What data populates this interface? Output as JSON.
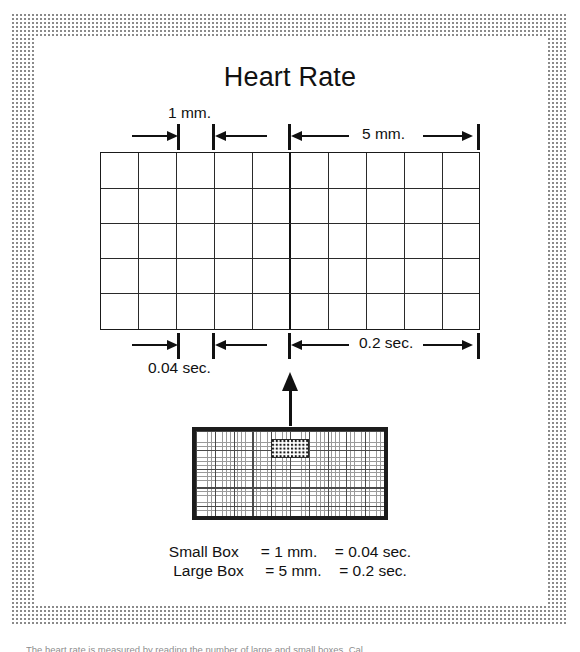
{
  "figure": {
    "title": "Heart Rate",
    "domain_note": "ECG paper calibration diagram"
  },
  "annotations": {
    "top": {
      "small_box_label": "1 mm.",
      "large_box_label": "5 mm."
    },
    "bottom": {
      "small_box_label": "0.04 sec.",
      "large_box_label": "0.2 sec."
    }
  },
  "legend": {
    "rows": [
      {
        "name": "Small Box",
        "size": "= 1 mm.",
        "time": "= 0.04 sec."
      },
      {
        "name": "Large Box",
        "size": "= 5 mm.",
        "time": "= 0.2 sec."
      }
    ]
  },
  "grid": {
    "columns": 10,
    "rows": 5,
    "heavy_divider_after_column": 5,
    "small_box_mm": 1,
    "large_box_mm": 5,
    "small_box_sec": 0.04,
    "large_box_sec": 0.2
  },
  "strip": {
    "name": "ecg-paper-strip",
    "highlight_label": "magnified-region"
  },
  "colors": {
    "ink": "#111111",
    "grid_line": "#2a2a2a",
    "frame_screen": "#8a8a8a",
    "paper": "#ffffff"
  },
  "caption": {
    "text": "The heart rate is measured by reading the number of large and small boxes. Cal."
  }
}
